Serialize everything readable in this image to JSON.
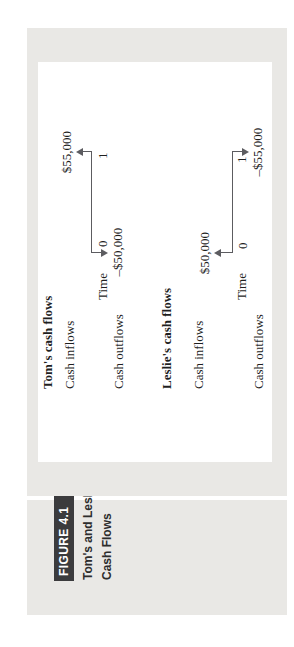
{
  "figure": {
    "box_label": "FIGURE 4.1",
    "title_line1": "Tom's and Leslie's",
    "title_line2": "Cash Flows"
  },
  "sections": [
    {
      "heading": "Tom's cash flows",
      "inflow_label": "Cash inflows",
      "outflow_label": "Cash outflows",
      "time_label": "Time",
      "tick0": "0",
      "tick1": "1",
      "inflow_amount": "$55,000",
      "inflow_time": "1",
      "outflow_amount": "–$50,000",
      "outflow_time": "0"
    },
    {
      "heading": "Leslie's cash flows",
      "inflow_label": "Cash inflows",
      "outflow_label": "Cash outflows",
      "time_label": "Time",
      "tick0": "0",
      "tick1": "1",
      "inflow_amount": "$50,000",
      "inflow_time": "0",
      "outflow_amount": "–$55,000",
      "outflow_time": "1"
    }
  ],
  "colors": {
    "panel": "#e9e8e5",
    "figure_box": "#3b3b3d",
    "line": "#5c5c60",
    "text": "#1f1f1f"
  }
}
